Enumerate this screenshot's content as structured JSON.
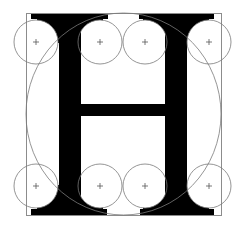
{
  "figure": {
    "letter": "H",
    "colors": {
      "background": "#ffffff",
      "glyph": "#000000",
      "guide": "#7a7a7a",
      "frame": "#8c8c8c"
    },
    "frame": {
      "x": 26,
      "y": 13,
      "w": 195,
      "h": 202
    },
    "ellipse": {
      "cx": 123.5,
      "cy": 114,
      "rx": 97.5,
      "ry": 101
    },
    "top_serifs": [
      {
        "x": 31,
        "y": 13,
        "w": 77,
        "h": 6
      },
      {
        "x": 139,
        "y": 13,
        "w": 75,
        "h": 6
      }
    ],
    "bottom_serifs": [
      {
        "x": 31,
        "y": 209,
        "w": 76,
        "h": 6
      },
      {
        "x": 140,
        "y": 209,
        "w": 74,
        "h": 6
      }
    ],
    "stems": [
      {
        "x": 59,
        "y": 13,
        "w": 22,
        "h": 202
      },
      {
        "x": 165,
        "y": 13,
        "w": 22,
        "h": 202
      }
    ],
    "crossbar": {
      "x": 81,
      "y": 104,
      "w": 84,
      "h": 12
    },
    "fillet_circles": [
      {
        "cx": 36,
        "cy": 42,
        "r": 22
      },
      {
        "cx": 100,
        "cy": 42,
        "r": 22
      },
      {
        "cx": 145,
        "cy": 42,
        "r": 22
      },
      {
        "cx": 209,
        "cy": 42,
        "r": 22
      },
      {
        "cx": 36,
        "cy": 186,
        "r": 22
      },
      {
        "cx": 100,
        "cy": 186,
        "r": 22
      },
      {
        "cx": 145,
        "cy": 186,
        "r": 22
      },
      {
        "cx": 209,
        "cy": 186,
        "r": 22
      }
    ],
    "center_mark_size": 3
  }
}
